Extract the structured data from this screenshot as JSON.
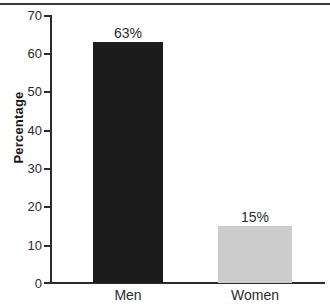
{
  "chart_data": {
    "type": "bar",
    "title": "",
    "xlabel": "",
    "ylabel": "Percentage",
    "categories": [
      "Men",
      "Women"
    ],
    "values": [
      63,
      15
    ],
    "data_labels": [
      "63%",
      "15%"
    ],
    "ylim": [
      0,
      70
    ],
    "y_ticks": [
      0,
      10,
      20,
      30,
      40,
      50,
      60,
      70
    ],
    "y_tick_labels": [
      "0",
      "10",
      "20",
      "30",
      "40",
      "50",
      "60",
      "70"
    ],
    "grid": false,
    "legend": false,
    "bar_colors": [
      "#1c1c1c",
      "#cccccc"
    ],
    "axis_color": "#2b2b2b"
  }
}
